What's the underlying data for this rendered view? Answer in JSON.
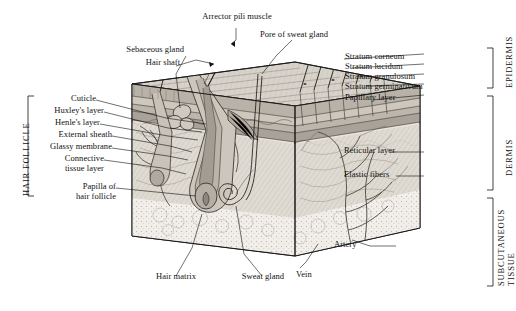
{
  "figure": {
    "style": "engraved line illustration, grayscale",
    "labels_top": [
      {
        "id": "arrector-pili-muscle",
        "text": "Arrector pili muscle"
      },
      {
        "id": "pore-of-sweat-gland",
        "text": "Pore of sweat gland"
      },
      {
        "id": "sebaceous-gland",
        "text": "Sebaceous gland"
      },
      {
        "id": "hair-shaft",
        "text": "Hair shaft"
      }
    ],
    "labels_right_upper": [
      {
        "id": "stratum-corneum",
        "text": "Stratum corneum"
      },
      {
        "id": "stratum-lucidum",
        "text": "Stratum lucidum"
      },
      {
        "id": "stratum-granulosum",
        "text": "Stratum granulosum"
      },
      {
        "id": "stratum-germinativum",
        "text": "Stratum germinativum"
      },
      {
        "id": "papillary-layer",
        "text": "Papillary layer"
      }
    ],
    "labels_right_lower": [
      {
        "id": "reticular-layer",
        "text": "Reticular layer"
      },
      {
        "id": "elastic-fibers",
        "text": "Elastic fibers"
      },
      {
        "id": "artery",
        "text": "Artery"
      },
      {
        "id": "vein",
        "text": "Vein"
      }
    ],
    "labels_left": [
      {
        "id": "cuticle",
        "text": "Cuticle"
      },
      {
        "id": "huxleys-layer",
        "text": "Huxley's layer"
      },
      {
        "id": "henles-layer",
        "text": "Henle's layer"
      },
      {
        "id": "external-sheath",
        "text": "External sheath"
      },
      {
        "id": "glassy-membrane",
        "text": "Glassy membrane"
      },
      {
        "id": "connective-tissue-layer",
        "text": "Connective\ntissue layer"
      },
      {
        "id": "papilla-of-hair-follicle",
        "text": "Papilla of\nhair follicle"
      }
    ],
    "labels_bottom": [
      {
        "id": "hair-matrix",
        "text": "Hair matrix"
      },
      {
        "id": "sweat-gland",
        "text": "Sweat gland"
      }
    ],
    "brackets": {
      "left": {
        "id": "hair-follicle",
        "text": "HAIR FOLLICLE"
      },
      "right": [
        {
          "id": "epidermis",
          "text": "EPIDERMIS"
        },
        {
          "id": "dermis",
          "text": "DERMIS"
        },
        {
          "id": "subcutaneous-tissue",
          "text": "SUBCUTANEOUS\nTISSUE"
        }
      ]
    }
  },
  "colors": {
    "ink": "#111111",
    "line": "#1a1a1a",
    "epidermis_fill": "#cfc8c0",
    "dermis_fill": "#ded9d2",
    "subcutaneous_fill": "#efece8",
    "hatch": "#8e8980"
  }
}
